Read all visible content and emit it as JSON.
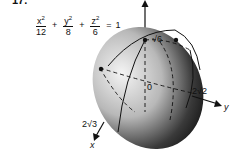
{
  "problem": {
    "number": "17."
  },
  "equation": {
    "terms": [
      {
        "numerator": "x",
        "exponent": "2",
        "denominator": "12"
      },
      {
        "numerator": "y",
        "exponent": "2",
        "denominator": "8"
      },
      {
        "numerator": "z",
        "exponent": "2",
        "denominator": "6"
      }
    ],
    "plus": "+",
    "equals": "=",
    "rhs": "1"
  },
  "figure": {
    "shape": "ellipsoid",
    "labels": {
      "z_intercept": "√6",
      "y_intercept": "2√2",
      "x_intercept": "2√3",
      "origin": "0",
      "x_axis": "x",
      "y_axis": "y",
      "z_axis": "z"
    },
    "colors": {
      "shade_light": "#f2f2f2",
      "shade_dark": "#1a1a1a",
      "line": "#111111"
    }
  }
}
